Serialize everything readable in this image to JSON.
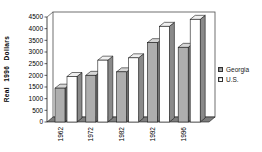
{
  "chart_data": {
    "type": "bar",
    "style": "3d-column",
    "title": "",
    "xlabel": "",
    "ylabel": "Real 1996 Dollars",
    "categories": [
      "1962",
      "1972",
      "1982",
      "1992",
      "1996"
    ],
    "series": [
      {
        "name": "Georgia",
        "values": [
          1450,
          2000,
          2150,
          3400,
          3200
        ],
        "front_color": "#aeaeae",
        "top_color": "#d6d6d6",
        "side_color": "#757575"
      },
      {
        "name": "U.S.",
        "values": [
          1950,
          2650,
          2750,
          4100,
          4400
        ],
        "front_color": "#ffffff",
        "top_color": "#f0f0f0",
        "side_color": "#8a8a8a"
      }
    ],
    "ylim": [
      0,
      4500
    ],
    "ytick_step": 500,
    "yticks": [
      0,
      500,
      1000,
      1500,
      2000,
      2500,
      3000,
      3500,
      4000,
      4500
    ],
    "grid": false,
    "legend_position": "right",
    "wall_color": "#ffffff",
    "floor_color": "#7d7d7d",
    "axis_color": "#1a1a1a",
    "outline_color": "#1a1a1a"
  }
}
